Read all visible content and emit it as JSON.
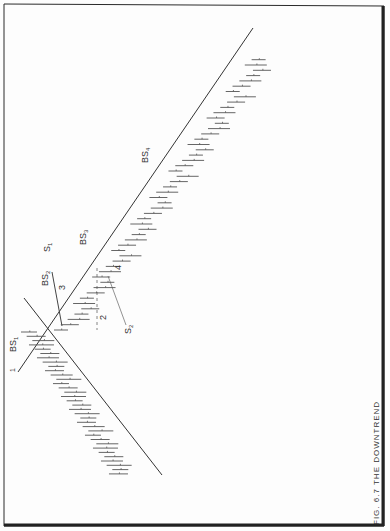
{
  "figure": {
    "caption": "FIG. 6.7 THE DOWNTREND",
    "orientation": "rotated 90° (page printed sideways)"
  },
  "labels": {
    "bs1": "BS",
    "bs1_sub": "1",
    "bs2": "BS",
    "bs2_sub": "2",
    "bs3": "BS",
    "bs3_sub": "3",
    "bs4": "BS",
    "bs4_sub": "4",
    "s1": "S",
    "s1_sub": "1",
    "s2": "S",
    "s2_sub": "2",
    "n1": "1",
    "n2": "2",
    "n3": "3",
    "n4": "4"
  },
  "colors": {
    "ink": "#333333",
    "border": "#222222",
    "paper": "#fdfdfd"
  },
  "chart_data": {
    "type": "bar",
    "subtype": "OHLC price bars with trendlines (rotated figure)",
    "title": "FIG. 6.7 THE DOWNTREND",
    "xlabel": "",
    "ylabel": "",
    "grid": false,
    "legend": "none",
    "annotations": [
      {
        "text": "BS1",
        "meaning": "Break of support 1 / initial trendline break"
      },
      {
        "text": "BS2",
        "meaning": "Break of support 2"
      },
      {
        "text": "BS3",
        "meaning": "Break of support 3"
      },
      {
        "text": "BS4",
        "meaning": "Break of support 4"
      },
      {
        "text": "S1",
        "meaning": "Signal 1 pointer"
      },
      {
        "text": "S2",
        "meaning": "Signal 2 pointer"
      },
      {
        "text": "1",
        "meaning": "Point 1"
      },
      {
        "text": "2",
        "meaning": "Point 2"
      },
      {
        "text": "3",
        "meaning": "Point 3"
      },
      {
        "text": "4",
        "meaning": "Point 4"
      }
    ],
    "trendlines": [
      {
        "name": "uptrend line (prior)",
        "from": [
          22,
          268
        ],
        "to": [
          158,
          475
        ]
      },
      {
        "name": "downtrend line",
        "from": [
          18,
          372
        ],
        "to": [
          253,
          55
        ]
      },
      {
        "name": "crossing line",
        "from": [
          24,
          298
        ],
        "to": [
          64,
          352
        ]
      }
    ],
    "series": [
      {
        "name": "price bars (pre-reversal uptrend)",
        "count": 34
      },
      {
        "name": "price bars (downtrend)",
        "count": 52
      }
    ]
  }
}
